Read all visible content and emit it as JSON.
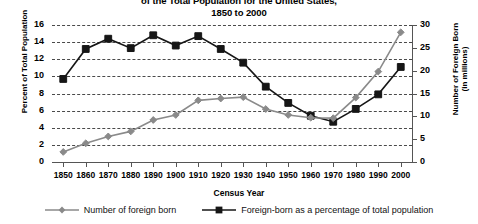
{
  "title": {
    "line1": "of the Total Population for the United States,",
    "line2": "1850 to 2000"
  },
  "axes": {
    "xlabel": "Census Year",
    "ylabel_left": "Percent of Total Population",
    "ylabel_right_line1": "Number of Foreign Born",
    "ylabel_right_line2": "(in millions)",
    "yticks_left": [
      "0",
      "2",
      "4",
      "6",
      "8",
      "10",
      "12",
      "14",
      "16"
    ],
    "yticks_right": [
      "0",
      "5",
      "10",
      "15",
      "20",
      "25",
      "30"
    ]
  },
  "legend": {
    "items": [
      {
        "label": "Number of foreign born",
        "color": "#8a8a8a",
        "marker": "diamond"
      },
      {
        "label": "Foreign-born as a percentage of total population",
        "color": "#161616",
        "marker": "square"
      }
    ]
  },
  "chart_data": {
    "type": "line",
    "xlabel": "Census Year",
    "ylabel": "Percent of Total Population",
    "ylabel_secondary": "Number of Foreign Born (in millions)",
    "grid": true,
    "legend_position": "bottom",
    "categories": [
      "1850",
      "1860",
      "1870",
      "1880",
      "1890",
      "1900",
      "1910",
      "1920",
      "1930",
      "1940",
      "1950",
      "1960",
      "1970",
      "1980",
      "1990",
      "2000"
    ],
    "ylim": [
      0,
      16
    ],
    "ylim_secondary": [
      0,
      30
    ],
    "series": [
      {
        "name": "Foreign-born as a percentage of total population",
        "axis": "left",
        "unit": "percent",
        "color": "#161616",
        "marker": "square",
        "values": [
          9.7,
          13.2,
          14.4,
          13.3,
          14.8,
          13.6,
          14.7,
          13.2,
          11.6,
          8.8,
          6.9,
          5.4,
          4.7,
          6.2,
          7.9,
          11.1
        ]
      },
      {
        "name": "Number of foreign born",
        "axis": "right",
        "unit": "millions",
        "color": "#8a8a8a",
        "marker": "diamond",
        "values": [
          2.2,
          4.1,
          5.6,
          6.7,
          9.2,
          10.3,
          13.5,
          13.9,
          14.2,
          11.6,
          10.3,
          9.7,
          9.6,
          14.1,
          19.8,
          28.4
        ]
      }
    ]
  }
}
